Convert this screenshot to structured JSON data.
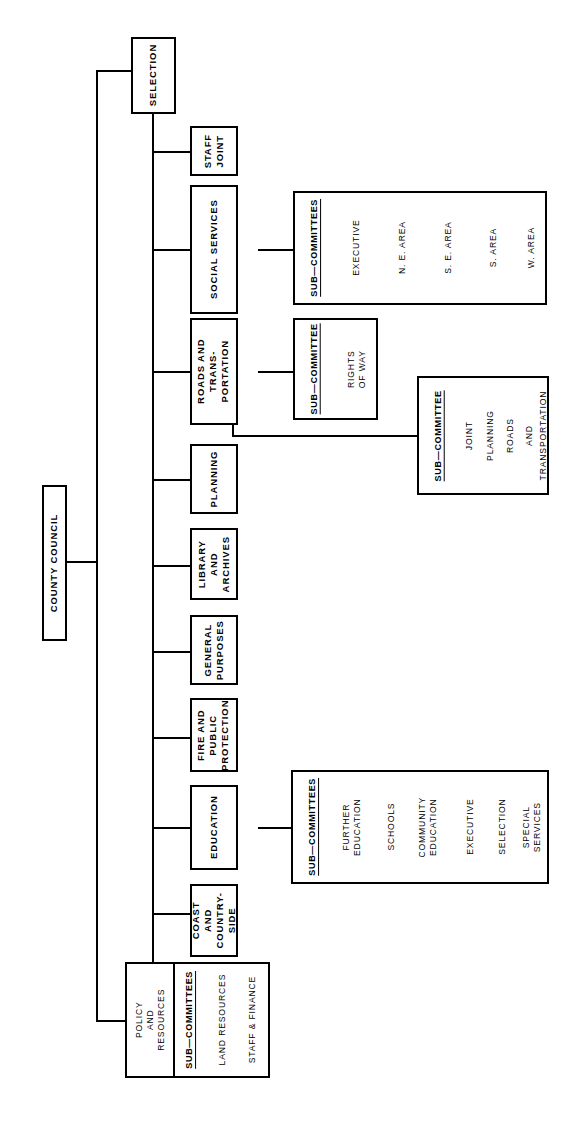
{
  "diagram": {
    "orientation": "rotated-90",
    "root": {
      "label": "COUNTY COUNCIL"
    },
    "subcommittee_heading_plural": "SUB—COMMITTEES",
    "subcommittee_heading_singular": "SUB—COMMITTEE",
    "committees": [
      {
        "id": "selection",
        "label": "SELECTION"
      },
      {
        "id": "staff-joint",
        "label": "STAFF\nJOINT"
      },
      {
        "id": "social-services",
        "label": "SOCIAL SERVICES"
      },
      {
        "id": "roads-and-transportation",
        "label": "ROADS AND\nTRANS-\nPORTATION"
      },
      {
        "id": "planning",
        "label": "PLANNING"
      },
      {
        "id": "library-and-archives",
        "label": "LIBRARY\nAND\nARCHIVES"
      },
      {
        "id": "general-purposes",
        "label": "GENERAL\nPURPOSES"
      },
      {
        "id": "fire-and-public-protection",
        "label": "FIRE AND\nPUBLIC\nPROTECTION"
      },
      {
        "id": "education",
        "label": "EDUCATION"
      },
      {
        "id": "coast-and-countryside",
        "label": "COAST\nAND\nCOUNTRY-\nSIDE"
      },
      {
        "id": "policy-and-resources",
        "label": "POLICY\nAND\nRESOURCES"
      }
    ],
    "subcommittee_groups": [
      {
        "id": "social-services-subcommittees",
        "parent": "social-services",
        "heading": "SUB—COMMITTEES",
        "items": [
          "EXECUTIVE",
          "N. E. AREA",
          "S. E. AREA",
          "S. AREA",
          "W. AREA"
        ]
      },
      {
        "id": "roads-rights-of-way",
        "parent": "roads-and-transportation",
        "heading": "SUB—COMMITTEE",
        "items": [
          "RIGHTS\nOF WAY"
        ]
      },
      {
        "id": "joint-planning-roads-transportation",
        "parent": "planning",
        "heading": "SUB—COMMITTEE",
        "items": [
          "JOINT",
          "PLANNING",
          "ROADS",
          "AND",
          "TRANSPORTATION"
        ]
      },
      {
        "id": "education-subcommittees",
        "parent": "education",
        "heading": "SUB—COMMITTEES",
        "items": [
          "FURTHER\nEDUCATION",
          "SCHOOLS",
          "COMMUNITY\nEDUCATION",
          "EXECUTIVE",
          "SELECTION",
          "SPECIAL\nSERVICES"
        ]
      },
      {
        "id": "policy-and-resources-subcommittees",
        "parent": "policy-and-resources",
        "heading": "SUB—COMMITTEES",
        "items": [
          "LAND RESOURCES",
          "STAFF & FINANCE"
        ]
      }
    ],
    "colors": {
      "stroke": "#000000",
      "background": "#ffffff",
      "text": "#000000"
    }
  }
}
